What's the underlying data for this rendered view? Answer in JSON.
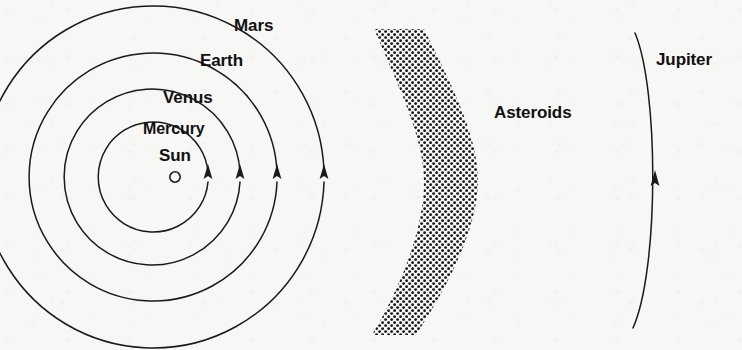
{
  "figure": {
    "background_color": "#f7f7f5",
    "ink_color": "#111111",
    "sun_center": {
      "x": 175,
      "y": 177
    },
    "labels": {
      "sun": "Sun",
      "mercury": "Mercury",
      "venus": "Venus",
      "earth": "Earth",
      "mars": "Mars",
      "asteroids": "Asteroids",
      "jupiter": "Jupiter"
    },
    "orbits": [
      {
        "name": "Mercury",
        "radius": 55,
        "arrow_x": 208,
        "arrow_y": 177
      },
      {
        "name": "Venus",
        "radius": 88,
        "arrow_x": 240,
        "arrow_y": 177
      },
      {
        "name": "Earth",
        "radius": 124,
        "arrow_x": 277,
        "arrow_y": 177
      },
      {
        "name": "Mars",
        "radius": 171,
        "arrow_x": 324,
        "arrow_y": 177
      }
    ],
    "asteroid_belt": {
      "label": "Asteroids",
      "fill": "stipple-dots",
      "top_x": 372,
      "bottom_x": 372,
      "mid_left_x": 422,
      "mid_right_x": 478,
      "top_y": 28,
      "bottom_y": 336
    },
    "jupiter_orbit": {
      "name": "Jupiter",
      "top": {
        "x": 635,
        "y": 33
      },
      "mid": {
        "x": 655,
        "y": 180
      },
      "bottom": {
        "x": 633,
        "y": 328
      },
      "arrow_x": 655,
      "arrow_y": 182
    }
  }
}
